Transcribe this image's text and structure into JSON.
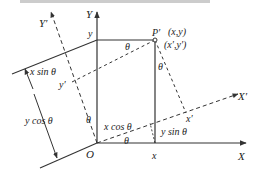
{
  "figure": {
    "top_caption_fragment": "...",
    "axes": {
      "x_label": "X",
      "y_label": "Y",
      "x_prime_label": "X′",
      "y_prime_label": "Y′",
      "origin_label": "O"
    },
    "point": {
      "name": "P′",
      "coords_original": "(x,y)",
      "coords_rotated": "(x′,y′)"
    },
    "ticks": {
      "x_on_X": "x",
      "y_on_Y": "y",
      "x_prime_on_X_prime": "x′",
      "y_prime_on_Y_prime": "y′"
    },
    "angle_labels": {
      "theta_top": "θ",
      "theta_right": "θ",
      "theta_left": "θ",
      "theta_bottom": "θ"
    },
    "segment_labels": {
      "x_sin": "x sin θ",
      "y_cos": "y cos θ",
      "x_cos": "x cos θ",
      "y_sin": "y sin θ"
    },
    "colors": {
      "line": "#333333",
      "text": "#222222"
    }
  }
}
